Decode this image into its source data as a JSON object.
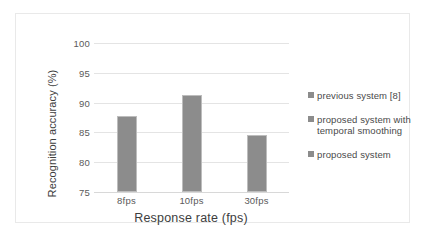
{
  "chart_data": {
    "type": "bar",
    "title": "",
    "subtitle": "",
    "categories": [
      "8fps",
      "10fps",
      "30fps"
    ],
    "values": [
      87.7,
      91.2,
      84.6
    ],
    "series": [
      {
        "name": "previous system [8]",
        "values": [
          87.7,
          91.2,
          84.6
        ]
      }
    ],
    "xlabel": "Response rate (fps)",
    "ylabel": "Recognition accuracy (%)",
    "ylim": [
      75,
      100
    ],
    "ytick_labels": [
      "100",
      "95",
      "90",
      "85",
      "80",
      "75"
    ],
    "ytick_values": [
      100,
      95,
      90,
      85,
      80,
      75
    ],
    "ytick_step": 5,
    "grid": true,
    "grid_axis": "y",
    "legend_position": "right",
    "legend": [
      "previous system [8]",
      "proposed system with temporal smoothing",
      "proposed system"
    ],
    "bar_color": "#8c8c8c",
    "bar_border_color": "#bdbdbd",
    "grid_color": "#e4e4e4",
    "background_color": "#ffffff",
    "frame_color": "#e9e9e9",
    "text_color": "#3d3d3d",
    "tick_text_color": "#5a5a5a"
  },
  "legend_entries": [
    {
      "label": "previous system [8]",
      "swatch": "#8c8c8c"
    },
    {
      "label": "proposed system with temporal smoothing",
      "swatch": "#8c8c8c"
    },
    {
      "label": "proposed system",
      "swatch": "#8c8c8c"
    }
  ]
}
